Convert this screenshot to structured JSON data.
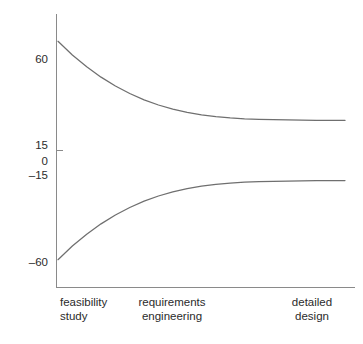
{
  "chart_data": {
    "type": "line",
    "title": "",
    "subtitle": "",
    "xlabel": "",
    "ylabel": "",
    "grid": false,
    "legend": "none",
    "xlim": [
      0,
      100
    ],
    "ylim": [
      -75,
      75
    ],
    "yticks": [
      60,
      15,
      0,
      -15,
      -60
    ],
    "ytick_labels": [
      "60",
      "15",
      "0",
      "–15",
      "–60"
    ],
    "xticks": [
      8,
      38,
      88
    ],
    "xtick_labels": [
      {
        "line1": "feasibility",
        "line2": "study"
      },
      {
        "line1": "requirements",
        "line2": "engineering"
      },
      {
        "line1": "detailed",
        "line2": "design"
      }
    ],
    "annotations": [],
    "series": [
      {
        "name": "upper bound",
        "x": [
          0,
          5,
          10,
          15,
          20,
          25,
          30,
          35,
          40,
          45,
          50,
          55,
          60,
          65,
          70,
          75,
          80,
          85,
          90,
          95,
          100
        ],
        "values": [
          60,
          52.5,
          46,
          40.3,
          35.4,
          31.3,
          27.8,
          25,
          22.7,
          21,
          19.6,
          18.6,
          17.9,
          17.4,
          17.1,
          16.9,
          16.8,
          16.7,
          16.6,
          16.6,
          16.5
        ]
      },
      {
        "name": "lower bound",
        "x": [
          0,
          5,
          10,
          15,
          20,
          25,
          30,
          35,
          40,
          45,
          50,
          55,
          60,
          65,
          70,
          75,
          80,
          85,
          90,
          95,
          100
        ],
        "values": [
          -60,
          -52.5,
          -46,
          -40.3,
          -35.4,
          -31.3,
          -27.8,
          -25,
          -22.7,
          -21,
          -19.6,
          -18.6,
          -17.9,
          -17.4,
          -17.1,
          -16.9,
          -16.8,
          -16.7,
          -16.6,
          -16.6,
          -16.5
        ]
      }
    ],
    "colors": {
      "curve": "#6f6f6f",
      "axis": "#8a8a8a",
      "text": "#2b2b2b",
      "background": "#ffffff"
    }
  },
  "axes": {
    "y_labels": {
      "t60": "60",
      "t15": "15",
      "t0": "0",
      "tm15": "–15",
      "tm60": "–60"
    },
    "x_labels": {
      "feasibility_l1": "feasibility",
      "feasibility_l2": "study",
      "requirements_l1": "requirements",
      "requirements_l2": "engineering",
      "detailed_l1": "detailed",
      "detailed_l2": "design"
    }
  }
}
